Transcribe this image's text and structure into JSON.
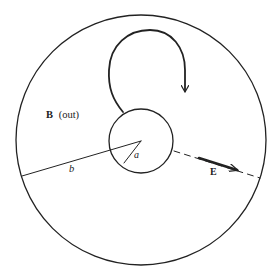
{
  "diagram": {
    "type": "coaxial-cross-section",
    "colors": {
      "ink": "#222222",
      "background": "#ffffff"
    },
    "outer_circle": {
      "cx": 141,
      "cy": 140,
      "r": 125
    },
    "inner_circle": {
      "cx": 141,
      "cy": 141,
      "r": 32
    },
    "labels": {
      "field_b": "B",
      "field_b_direction": "(out)",
      "radius_outer": "b",
      "radius_inner": "a",
      "field_e": "E"
    },
    "radius_b_line": {
      "x1": 22,
      "y1": 176,
      "x2": 141,
      "y2": 141
    },
    "radius_a_line": {
      "x1": 141,
      "y1": 141,
      "x2": 124,
      "y2": 163
    },
    "e_dashed_line": {
      "x1": 174,
      "y1": 151,
      "x2": 260,
      "y2": 178
    },
    "e_arrow": {
      "x1": 199,
      "y1": 158,
      "x2": 238,
      "y2": 170
    },
    "loop_arrow": {
      "start": [
        123,
        112
      ],
      "tip": [
        185,
        93
      ]
    }
  }
}
